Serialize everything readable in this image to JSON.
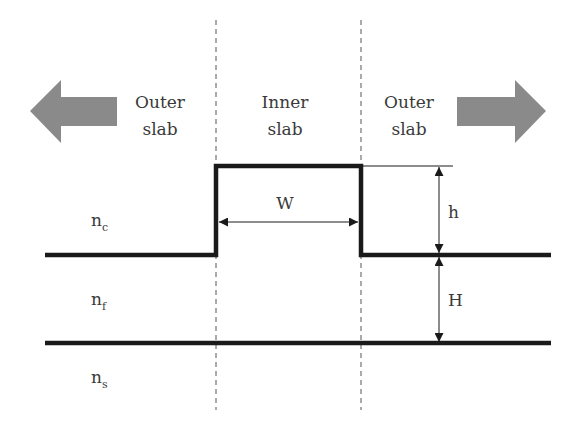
{
  "diagram": {
    "regions": {
      "left": {
        "line1": "Outer",
        "line2": "slab"
      },
      "center": {
        "line1": "Inner",
        "line2": "slab"
      },
      "right": {
        "line1": "Outer",
        "line2": "slab"
      }
    },
    "indices": {
      "cover": {
        "base": "n",
        "sub": "c"
      },
      "film": {
        "base": "n",
        "sub": "f"
      },
      "substrate": {
        "base": "n",
        "sub": "s"
      }
    },
    "dimensions": {
      "width": "W",
      "rib_height": "h",
      "slab_height": "H"
    },
    "arrows": {
      "left": "left-arrow",
      "right": "right-arrow"
    },
    "colors": {
      "line": "#1a1a1a",
      "arrow_fill": "#8a8a8a",
      "dashed": "#555555",
      "text": "#3a3a3a"
    }
  }
}
